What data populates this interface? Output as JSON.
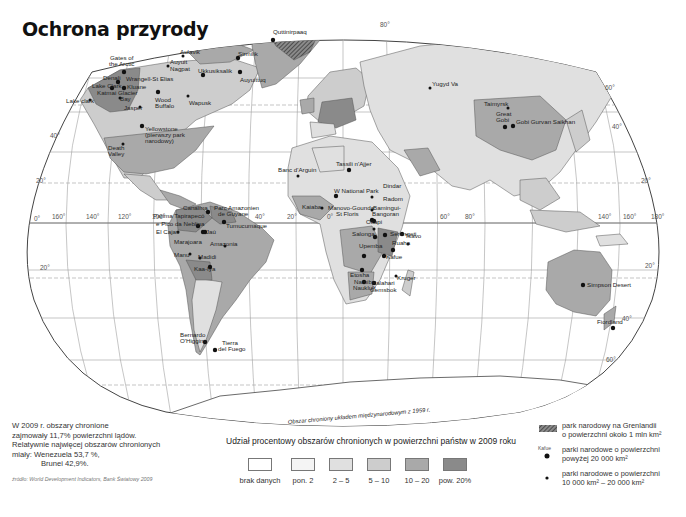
{
  "title": "Ochrona przyrody",
  "map": {
    "projection": "Robinson-like world map",
    "colors": {
      "ocean": "#ffffff",
      "brak_danych": "#ffffff",
      "pon_2": "#f4f4f4",
      "2_5": "#e0e0e0",
      "5_10": "#cdcdcd",
      "10_20": "#a9a9a9",
      "pow_20": "#8a8a8a",
      "graticule": "#9a9a9a",
      "border": "#555555"
    },
    "longitude_labels": [
      "160°",
      "140°",
      "120°",
      "100°",
      "40°",
      "20°",
      "20°",
      "0°",
      "60°",
      "80°",
      "140°",
      "160°",
      "180°"
    ],
    "latitude_labels": [
      "0°",
      "20°",
      "40°",
      "40°",
      "60°",
      "20°",
      "80°",
      "60°"
    ],
    "antarctica_label": "Obszar chroniony układem międzynarodowym z 1959 r.",
    "parks": [
      {
        "name": "Gates of the Arctic",
        "size": "large"
      },
      {
        "name": "Wrangell-St Elias",
        "size": "large"
      },
      {
        "name": "Denali",
        "size": "large"
      },
      {
        "name": "Lake Clark",
        "size": "large"
      },
      {
        "name": "Kluane",
        "size": "large"
      },
      {
        "name": "Katmai",
        "size": "medium"
      },
      {
        "name": "Glacier Bay",
        "size": "medium"
      },
      {
        "name": "Lake clark",
        "size": "medium"
      },
      {
        "name": "Aulavik",
        "size": "medium"
      },
      {
        "name": "Auyuittuq Nagpat",
        "size": "medium"
      },
      {
        "name": "Quttinirpaaq",
        "size": "large"
      },
      {
        "name": "Sirmilik",
        "size": "large"
      },
      {
        "name": "Ukkusiksalik",
        "size": "large"
      },
      {
        "name": "Auyuittuq",
        "size": "large"
      },
      {
        "name": "Wood Buffalo",
        "size": "large"
      },
      {
        "name": "Wapusk",
        "size": "medium"
      },
      {
        "name": "Jasper",
        "size": "medium"
      },
      {
        "name": "Yellowstone (pierwszy park narodowy)",
        "size": "large"
      },
      {
        "name": "Death Valley",
        "size": "medium"
      },
      {
        "name": "Canaima",
        "size": "large"
      },
      {
        "name": "Parc Amazonien de Guyane",
        "size": "large"
      },
      {
        "name": "Parima Tapirapecó",
        "size": "large"
      },
      {
        "name": "Pico da Neblina",
        "size": "large"
      },
      {
        "name": "Tumucumaque",
        "size": "large"
      },
      {
        "name": "El Cajas",
        "size": "medium"
      },
      {
        "name": "Jaú",
        "size": "large"
      },
      {
        "name": "Amazonia",
        "size": "medium"
      },
      {
        "name": "Manu",
        "size": "medium"
      },
      {
        "name": "Madidi",
        "size": "medium"
      },
      {
        "name": "Kaa-Iya",
        "size": "large"
      },
      {
        "name": "Bernardo O'Higgins",
        "size": "large"
      },
      {
        "name": "Tierra del Fuego",
        "size": "large"
      },
      {
        "name": "Banc d'Arguin",
        "size": "medium"
      },
      {
        "name": "Tassili n'Ajjer",
        "size": "large"
      },
      {
        "name": "W National Park",
        "size": "large"
      },
      {
        "name": "Kaiaba",
        "size": "medium"
      },
      {
        "name": "Manovo-Gounda St Floris",
        "size": "large"
      },
      {
        "name": "Dindar",
        "size": "medium"
      },
      {
        "name": "Radom",
        "size": "medium"
      },
      {
        "name": "Bamingui-Bangoran",
        "size": "large"
      },
      {
        "name": "Salonga",
        "size": "large"
      },
      {
        "name": "Upemba",
        "size": "large"
      },
      {
        "name": "Tsavo",
        "size": "large"
      },
      {
        "name": "Serengeti",
        "size": "large"
      },
      {
        "name": "Ruaha",
        "size": "medium"
      },
      {
        "name": "Kafue",
        "size": "large"
      },
      {
        "name": "Etosha",
        "size": "large"
      },
      {
        "name": "Namib Naukluft",
        "size": "large"
      },
      {
        "name": "Kalahari Gemsbok",
        "size": "large"
      },
      {
        "name": "Kruger",
        "size": "medium"
      },
      {
        "name": "Yugyd Va",
        "size": "medium"
      },
      {
        "name": "Taimyrsk",
        "size": "medium"
      },
      {
        "name": "Great Gobi",
        "size": "large"
      },
      {
        "name": "Gobi Gurvan Saikhan",
        "size": "large"
      },
      {
        "name": "Simpson Desert",
        "size": "large"
      },
      {
        "name": "Fiordland",
        "size": "large"
      }
    ]
  },
  "note": {
    "line1": "W 2009 r. obszary chronione",
    "line2": "zajmowały 11,7% powierzchni lądów.",
    "line3": "Relatywnie najwięcej obszarów chronionych",
    "line4": "miały: Wenezuela 53,7 %,",
    "line5": "Brunei 42,9%."
  },
  "source": "źródło: World Development Indicators, Bank Światowy 2009",
  "legend": {
    "title": "Udział procentowy obszarów chronionych w powierzchni państw w 2009 roku",
    "classes": [
      {
        "label": "brak danych",
        "color": "#ffffff"
      },
      {
        "label": "pon. 2",
        "color": "#f4f4f4"
      },
      {
        "label": "2 – 5",
        "color": "#e0e0e0"
      },
      {
        "label": "5 – 10",
        "color": "#cdcdcd"
      },
      {
        "label": "10 – 20",
        "color": "#a9a9a9"
      },
      {
        "label": "pow. 20%",
        "color": "#8a8a8a"
      }
    ]
  },
  "symbols": {
    "greenland_line1": "park narodowy na Grenlandii",
    "greenland_line2": "o powierzchni około 1 mln km²",
    "example_label": "Kafue",
    "large_line1": "parki narodowe o powierzchni",
    "large_line2": "powyżej 20 000 km²",
    "medium_line1": "parki narodowe o powierzchni",
    "medium_line2": "10 000 km² – 20 000 km²"
  }
}
